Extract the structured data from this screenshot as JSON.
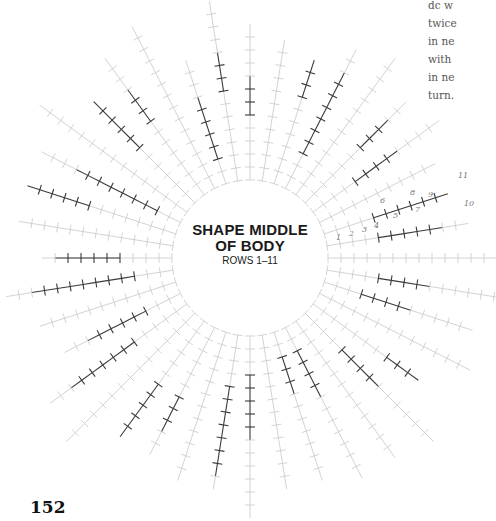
{
  "figure": {
    "center_label": {
      "title_line1": "SHAPE MIDDLE",
      "title_line2": "OF BODY",
      "subtitle": "ROWS 1–11"
    },
    "page_number": "152",
    "side_text_lines": [
      "dc w",
      "twice",
      "in ne",
      "with",
      "in ne",
      "turn."
    ],
    "colors": {
      "dark_stitch": "#3a3a3a",
      "light_stitch": "#c8c8c8",
      "text": "#1a1a1a",
      "handwriting": "#777777"
    },
    "diagram": {
      "type": "radial-crochet-stitch-chart",
      "center": [
        250,
        258
      ],
      "inner_radius": 78,
      "ray_count": 40,
      "stitch_symbol": "cross (single crochet)",
      "handwritten_row_numbers": [
        "1",
        "2",
        "3",
        "4",
        "5",
        "6",
        "7",
        "8",
        "9",
        "10",
        "11"
      ]
    }
  }
}
